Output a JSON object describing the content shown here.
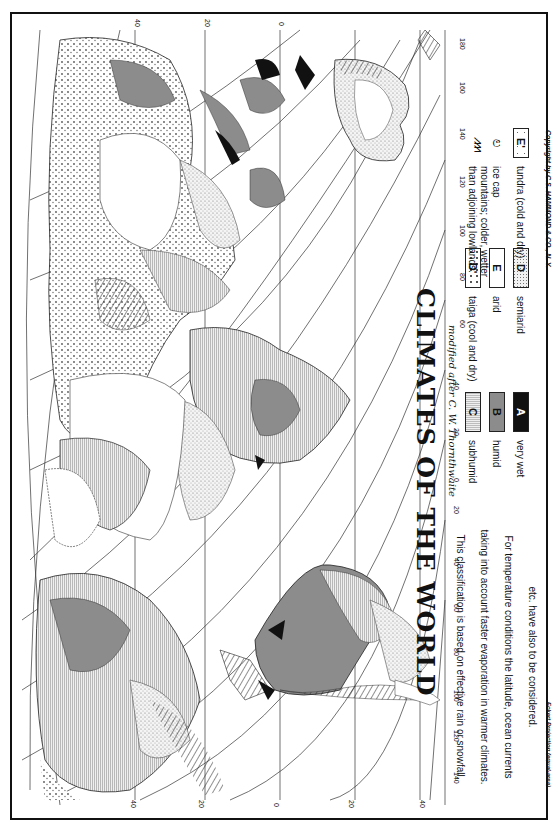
{
  "map": {
    "title": "CLIMATES OF THE WORLD",
    "subtitle": "modified after C. W. Thornthwaite",
    "orientation": "rotated 90° clockwise (north at left)",
    "projection_note": "Eckert Projection (equal-area)",
    "copyright": "Copyright by C.S. HAMMOND & CO., N. Y.",
    "description_lines": [
      "This classification is based on effective rain or snowfall,",
      "taking into account faster evaporation in warmer climates.",
      "For temperature conditions the latitude, ocean currents",
      "etc. have also to be considered."
    ],
    "latitude_labels_top": [
      "40",
      "20",
      "0"
    ],
    "latitude_labels_bottom": [
      "40",
      "20",
      "0",
      "20",
      "40"
    ],
    "longitude_labels_right": [
      "180",
      "160",
      "140",
      "120",
      "100",
      "80",
      "60",
      "40",
      "20",
      "0",
      "20",
      "40",
      "60",
      "80",
      "100",
      "120",
      "140"
    ],
    "colors": {
      "very_wet": "#111111",
      "humid": "#8c8c8c",
      "subhumid": "#d0d0d0",
      "semiarid": "#ececec",
      "arid": "#ffffff",
      "frame": "#111111"
    }
  },
  "legend": {
    "items": [
      {
        "code": "A",
        "label": "very wet"
      },
      {
        "code": "B",
        "label": "humid"
      },
      {
        "code": "C",
        "label": "subhumid"
      },
      {
        "code": "D",
        "label": "semiarid"
      },
      {
        "code": "E",
        "label": "arid"
      },
      {
        "code": "D'",
        "label": "taiga (cool and dry)"
      },
      {
        "code": "E'",
        "label": "tundra (cold and dry)"
      },
      {
        "code": "",
        "label": "ice cap"
      },
      {
        "code": "",
        "label": "mountains; colder, wetter than adjoining lowlands."
      }
    ]
  }
}
